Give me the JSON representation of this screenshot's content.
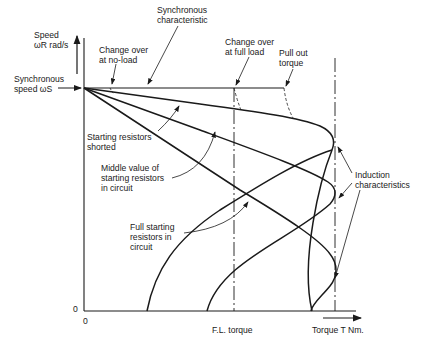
{
  "diagram": {
    "type": "speed-torque characteristics",
    "y_axis": {
      "label_line1": "Speed",
      "label_line2": "ωR rad/s",
      "zero": "0"
    },
    "x_axis": {
      "label": "Torque T Nm.",
      "zero": "0",
      "fl_torque": "F.L. torque"
    },
    "sync_speed": {
      "line1": "Synchronous",
      "line2": "speed ωS"
    },
    "annotations": {
      "sync_char": {
        "line1": "Synchronous",
        "line2": "characteristic"
      },
      "change_noload": {
        "line1": "Change over",
        "line2": "at no-load"
      },
      "change_fullload": {
        "line1": "Change over",
        "line2": "at full load"
      },
      "pullout": {
        "line1": "Pull out",
        "line2": "torque"
      },
      "resistors_shorted": {
        "line1": "Starting resistors",
        "line2": "shorted"
      },
      "middle_value": {
        "line1": "Middle value of",
        "line2": "starting resistors",
        "line3": "in circuit"
      },
      "full_starting": {
        "line1": "Full starting",
        "line2": "resistors in",
        "line3": "circuit"
      },
      "induction": {
        "line1": "Induction",
        "line2": "characteristics"
      }
    },
    "curves": [
      {
        "name": "Starting resistors shorted",
        "stall_torque_x": 311,
        "peak_y": 140
      },
      {
        "name": "Middle value of starting resistors in circuit",
        "stall_torque_x": 207,
        "peak_y": 192
      },
      {
        "name": "Full starting resistors in circuit",
        "stall_torque_x": 147,
        "peak_y": 272
      }
    ]
  }
}
